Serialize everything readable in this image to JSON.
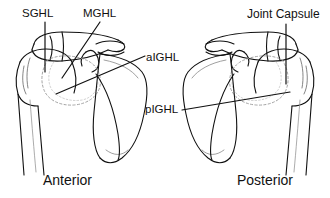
{
  "figure": {
    "name": "shoulder-glenohumeral-ligaments",
    "background_color": "#ffffff",
    "line_color": "#111111",
    "width": 330,
    "height": 198
  },
  "panels": [
    {
      "id": "anterior",
      "caption": "Anterior",
      "side": "left",
      "labels": [
        {
          "id": "sghl",
          "text": "SGHL",
          "leader": "vertical"
        },
        {
          "id": "mghl",
          "text": "MGHL",
          "leader": "diagonal"
        },
        {
          "id": "aighl",
          "text": "aIGHL",
          "leader": "horizontal"
        },
        {
          "id": "pighl",
          "text": "pIGHL",
          "leader": "diagonal"
        }
      ]
    },
    {
      "id": "posterior",
      "caption": "Posterior",
      "side": "right",
      "labels": [
        {
          "id": "joint-capsule",
          "text": "Joint Capsule",
          "leader": "vertical"
        }
      ]
    }
  ],
  "labels": {
    "sghl": "SGHL",
    "mghl": "MGHL",
    "aighl": "aIGHL",
    "pighl": "pIGHL",
    "joint_capsule": "Joint Capsule"
  },
  "captions": {
    "anterior": "Anterior",
    "posterior": "Posterior"
  }
}
